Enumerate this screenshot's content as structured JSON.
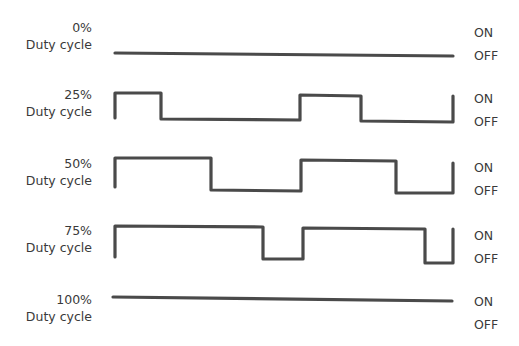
{
  "color": {
    "wave": "#4a4a4a",
    "text": "#3a3a3a"
  },
  "rows": [
    {
      "percent": "0%",
      "caption": "Duty cycle",
      "on": "ON",
      "off": "OFF",
      "points": "115,53 453,56"
    },
    {
      "percent": "25%",
      "caption": "Duty cycle",
      "on": "ON",
      "off": "OFF",
      "points": "115,118 115,93 161,93 161,119 300,120 300,95 361,96 361,121 453,122 453,96"
    },
    {
      "percent": "50%",
      "caption": "Duty cycle",
      "on": "ON",
      "off": "OFF",
      "points": "115,187 115,158 211,158 211,190 301,191 301,160 396,161 396,193 453,193 453,163"
    },
    {
      "percent": "75%",
      "caption": "Duty cycle",
      "on": "ON",
      "off": "OFF",
      "points": "115,257 115,226 263,227 263,259 303,259 303,228 425,229 425,263 453,263 453,229"
    },
    {
      "percent": "100%",
      "caption": "Duty cycle",
      "on": "ON",
      "off": "OFF",
      "points": "113,297 452,301"
    }
  ]
}
